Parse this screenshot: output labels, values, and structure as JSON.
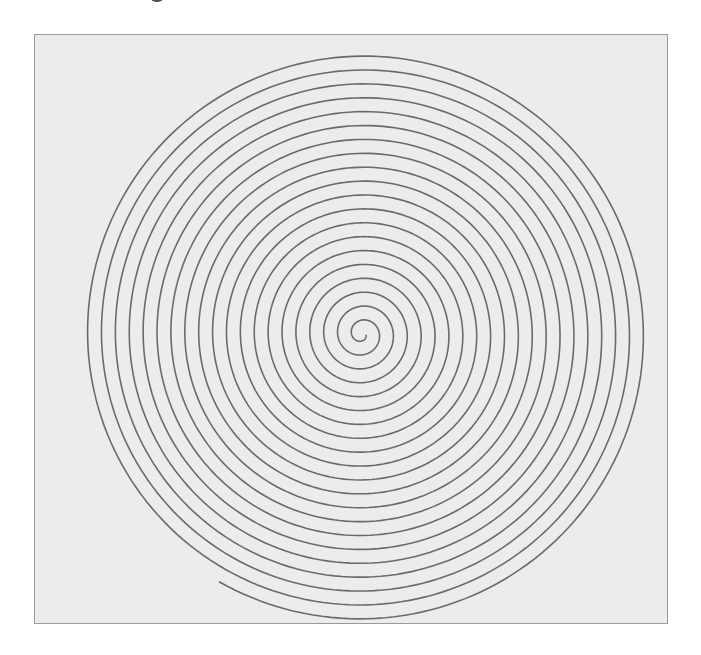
{
  "figure": {
    "type": "archimedean-spiral",
    "center": [
      362,
      334
    ],
    "start_radius": 4,
    "end_radius": 286,
    "turns": 20.3,
    "start_angle_deg": 0,
    "end_angle_deg": 120,
    "stroke_color": "#6a6a6a",
    "stroke_width": 1.6,
    "background_color": "#ececec",
    "border_color": "#9a9a9a"
  }
}
